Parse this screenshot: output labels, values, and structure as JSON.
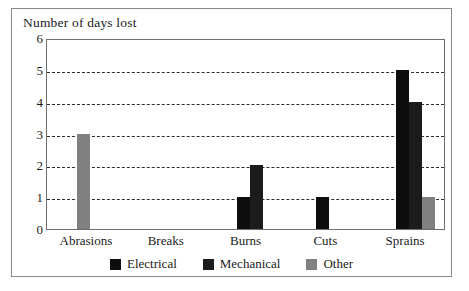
{
  "chart_data": {
    "type": "bar",
    "title": "Number of days lost",
    "xlabel": "",
    "ylabel": "Number of days lost",
    "ylim": [
      0,
      6
    ],
    "yticks": [
      0,
      1,
      2,
      3,
      4,
      5,
      6
    ],
    "grid": true,
    "grid_style": "dashed-horizontal",
    "legend_position": "bottom-center",
    "categories": [
      "Abrasions",
      "Breaks",
      "Burns",
      "Cuts",
      "Sprains"
    ],
    "series": [
      {
        "name": "Electrical",
        "color": "#0d0d0d",
        "values": [
          0,
          0,
          1,
          1,
          5
        ]
      },
      {
        "name": "Mechanical",
        "color": "#1c1c1c",
        "values": [
          0,
          0,
          2,
          0,
          4
        ]
      },
      {
        "name": "Other",
        "color": "#808080",
        "values": [
          3,
          0,
          0,
          0,
          1
        ]
      }
    ]
  },
  "legend": {
    "items": [
      {
        "label": "Electrical",
        "color": "#0d0d0d"
      },
      {
        "label": "Mechanical",
        "color": "#1c1c1c"
      },
      {
        "label": "Other",
        "color": "#808080"
      }
    ]
  }
}
